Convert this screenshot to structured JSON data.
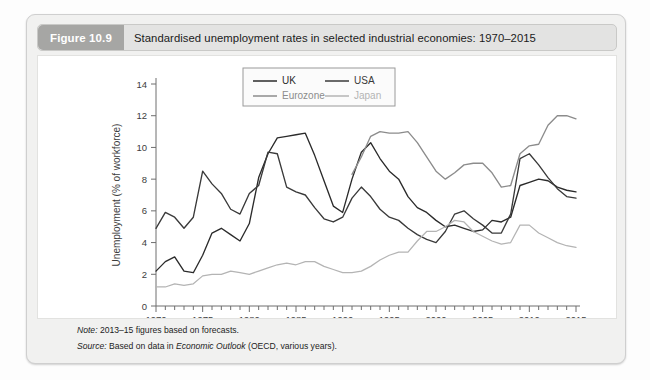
{
  "figure": {
    "number_label": "Figure 10.9",
    "title": "Standardised unemployment rates in selected industrial economies: 1970–2015",
    "note": "2013–15 figures based on forecasts.",
    "note_prefix": "Note:",
    "source_prefix": "Source:",
    "source_part1": "Based on data in ",
    "source_italic": "Economic Outlook",
    "source_part2": " (OECD, various years)."
  },
  "colors": {
    "uk": "#2b2b2b",
    "usa": "#3a3a3a",
    "eurozone": "#8c8c8c",
    "japan": "#b4b4b4",
    "axis": "#6e6e6e",
    "text": "#3d3d3d",
    "header_badge": "#a6a6a4",
    "header_bar": "#e3e3e2",
    "card_bg": "#f1f1f0"
  },
  "chart_data": {
    "type": "line",
    "title": "Standardised unemployment rates in selected industrial economies: 1970–2015",
    "xlabel": "",
    "ylabel": "Unemployment (% of workforce)",
    "xlim": [
      1970,
      2015
    ],
    "ylim": [
      0,
      14
    ],
    "ytick_step": 2,
    "yticks": [
      0,
      2,
      4,
      6,
      8,
      10,
      12,
      14
    ],
    "xticks_major": [
      1970,
      1975,
      1980,
      1985,
      1990,
      1995,
      2000,
      2005,
      2010,
      2015
    ],
    "xticks_minor_step": 1,
    "grid": false,
    "legend_position": "top-center",
    "legend": [
      {
        "name": "UK",
        "color": "#2b2b2b"
      },
      {
        "name": "USA",
        "color": "#3a3a3a"
      },
      {
        "name": "Eurozone",
        "color": "#8c8c8c"
      },
      {
        "name": "Japan",
        "color": "#b4b4b4"
      }
    ],
    "series": [
      {
        "name": "UK",
        "color": "#2b2b2b",
        "x": [
          1970,
          1971,
          1972,
          1973,
          1974,
          1975,
          1976,
          1977,
          1978,
          1979,
          1980,
          1981,
          1982,
          1983,
          1984,
          1985,
          1986,
          1987,
          1988,
          1989,
          1990,
          1991,
          1992,
          1993,
          1994,
          1995,
          1996,
          1997,
          1998,
          1999,
          2000,
          2001,
          2002,
          2003,
          2004,
          2005,
          2006,
          2007,
          2008,
          2009,
          2010,
          2011,
          2012,
          2013,
          2014,
          2015
        ],
        "y": [
          2.2,
          2.8,
          3.1,
          2.2,
          2.1,
          3.2,
          4.6,
          4.9,
          4.5,
          4.1,
          5.2,
          8.1,
          9.6,
          10.6,
          10.7,
          10.8,
          10.9,
          9.5,
          7.9,
          6.3,
          5.9,
          8.0,
          9.7,
          10.3,
          9.3,
          8.5,
          8.0,
          6.9,
          6.2,
          5.9,
          5.4,
          5.0,
          5.1,
          4.9,
          4.7,
          4.8,
          5.4,
          5.3,
          5.6,
          7.6,
          7.8,
          8.0,
          7.9,
          7.5,
          7.3,
          7.2
        ]
      },
      {
        "name": "USA",
        "color": "#3a3a3a",
        "x": [
          1970,
          1971,
          1972,
          1973,
          1974,
          1975,
          1976,
          1977,
          1978,
          1979,
          1980,
          1981,
          1982,
          1983,
          1984,
          1985,
          1986,
          1987,
          1988,
          1989,
          1990,
          1991,
          1992,
          1993,
          1994,
          1995,
          1996,
          1997,
          1998,
          1999,
          2000,
          2001,
          2002,
          2003,
          2004,
          2005,
          2006,
          2007,
          2008,
          2009,
          2010,
          2011,
          2012,
          2013,
          2014,
          2015
        ],
        "y": [
          4.9,
          5.9,
          5.6,
          4.9,
          5.6,
          8.5,
          7.7,
          7.1,
          6.1,
          5.8,
          7.1,
          7.6,
          9.7,
          9.6,
          7.5,
          7.2,
          7.0,
          6.2,
          5.5,
          5.3,
          5.6,
          6.8,
          7.5,
          6.9,
          6.1,
          5.6,
          5.4,
          4.9,
          4.5,
          4.2,
          4.0,
          4.7,
          5.8,
          6.0,
          5.5,
          5.1,
          4.6,
          4.6,
          5.8,
          9.3,
          9.6,
          8.9,
          8.1,
          7.4,
          6.9,
          6.8
        ]
      },
      {
        "name": "Eurozone",
        "color": "#8c8c8c",
        "x": [
          1991,
          1992,
          1993,
          1994,
          1995,
          1996,
          1997,
          1998,
          1999,
          2000,
          2001,
          2002,
          2003,
          2004,
          2005,
          2006,
          2007,
          2008,
          2009,
          2010,
          2011,
          2012,
          2013,
          2014,
          2015
        ],
        "y": [
          8.3,
          9.4,
          10.7,
          11.0,
          10.9,
          10.9,
          11.0,
          10.3,
          9.4,
          8.5,
          8.0,
          8.4,
          8.9,
          9.0,
          9.0,
          8.4,
          7.5,
          7.6,
          9.6,
          10.1,
          10.2,
          11.4,
          12.0,
          12.0,
          11.8
        ]
      },
      {
        "name": "Japan",
        "color": "#b4b4b4",
        "x": [
          1970,
          1971,
          1972,
          1973,
          1974,
          1975,
          1976,
          1977,
          1978,
          1979,
          1980,
          1981,
          1982,
          1983,
          1984,
          1985,
          1986,
          1987,
          1988,
          1989,
          1990,
          1991,
          1992,
          1993,
          1994,
          1995,
          1996,
          1997,
          1998,
          1999,
          2000,
          2001,
          2002,
          2003,
          2004,
          2005,
          2006,
          2007,
          2008,
          2009,
          2010,
          2011,
          2012,
          2013,
          2014,
          2015
        ],
        "y": [
          1.2,
          1.2,
          1.4,
          1.3,
          1.4,
          1.9,
          2.0,
          2.0,
          2.2,
          2.1,
          2.0,
          2.2,
          2.4,
          2.6,
          2.7,
          2.6,
          2.8,
          2.8,
          2.5,
          2.3,
          2.1,
          2.1,
          2.2,
          2.5,
          2.9,
          3.2,
          3.4,
          3.4,
          4.1,
          4.7,
          4.7,
          5.0,
          5.4,
          5.3,
          4.7,
          4.4,
          4.1,
          3.9,
          4.0,
          5.1,
          5.1,
          4.6,
          4.3,
          4.0,
          3.8,
          3.7
        ]
      }
    ]
  }
}
